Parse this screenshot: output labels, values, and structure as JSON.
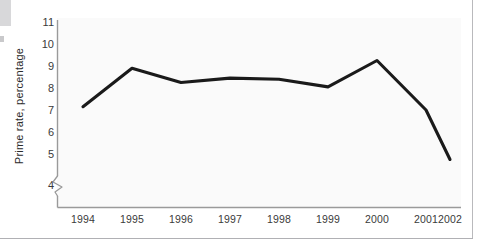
{
  "chart_data": {
    "type": "line",
    "title": "",
    "subtitle": "",
    "xlabel": "",
    "ylabel": "Prime rate, percentage",
    "categories": [
      "1994",
      "1995",
      "1996",
      "1997",
      "1998",
      "1999",
      "2000",
      "2001",
      "2002"
    ],
    "values": [
      7.15,
      8.9,
      8.25,
      8.45,
      8.4,
      8.05,
      9.25,
      7.0,
      4.75
    ],
    "series": [
      {
        "name": "Prime rate",
        "values": [
          7.15,
          8.9,
          8.25,
          8.45,
          8.4,
          8.05,
          9.25,
          7.0,
          4.75
        ]
      }
    ],
    "ylim": [
      4,
      11
    ],
    "y_ticks": [
      "4",
      "5",
      "6",
      "7",
      "8",
      "9",
      "10",
      "11"
    ],
    "x_ticks": [
      "1994",
      "1995",
      "1996",
      "1997",
      "1998",
      "1999",
      "2000",
      "2001",
      "2002"
    ],
    "grid": false,
    "legend": null,
    "legend_position": "none",
    "axis_break": true,
    "line_color": "#1a1a1a",
    "plot_background": "#fafafa",
    "axis_color": "#9a9a9a",
    "text_color": "#3a3a3a"
  },
  "axis": {
    "y_title": "Prime rate, percentage"
  }
}
